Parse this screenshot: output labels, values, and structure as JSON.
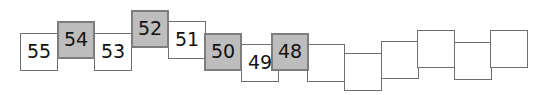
{
  "figure": {
    "kind": "number-sequence-strip",
    "box_count": 14,
    "colors": {
      "filled_fill": "#bdbdbd",
      "filled_border": "#7d7d7d",
      "plain_fill": "#ffffff",
      "plain_border": "#6e6e6e",
      "text": "#121212",
      "background": "#ffffff"
    },
    "boxes": [
      {
        "label": "55",
        "filled": false,
        "x": 20,
        "y": 33,
        "z": 1
      },
      {
        "label": "54",
        "filled": true,
        "x": 57,
        "y": 21,
        "z": 2
      },
      {
        "label": "53",
        "filled": false,
        "x": 94,
        "y": 33,
        "z": 1
      },
      {
        "label": "52",
        "filled": true,
        "x": 131,
        "y": 10,
        "z": 2
      },
      {
        "label": "51",
        "filled": false,
        "x": 168,
        "y": 21,
        "z": 1
      },
      {
        "label": "50",
        "filled": true,
        "x": 204,
        "y": 33,
        "z": 2
      },
      {
        "label": "49",
        "filled": false,
        "x": 241,
        "y": 44,
        "z": 1
      },
      {
        "label": "48",
        "filled": true,
        "x": 271,
        "y": 33,
        "z": 2
      },
      {
        "label": "",
        "filled": false,
        "x": 307,
        "y": 44,
        "z": 1
      },
      {
        "label": "",
        "filled": false,
        "x": 344,
        "y": 53,
        "z": 1
      },
      {
        "label": "",
        "filled": false,
        "x": 381,
        "y": 41,
        "z": 1
      },
      {
        "label": "",
        "filled": false,
        "x": 417,
        "y": 30,
        "z": 1
      },
      {
        "label": "",
        "filled": false,
        "x": 454,
        "y": 42,
        "z": 1
      },
      {
        "label": "",
        "filled": false,
        "x": 490,
        "y": 30,
        "z": 1
      }
    ]
  }
}
